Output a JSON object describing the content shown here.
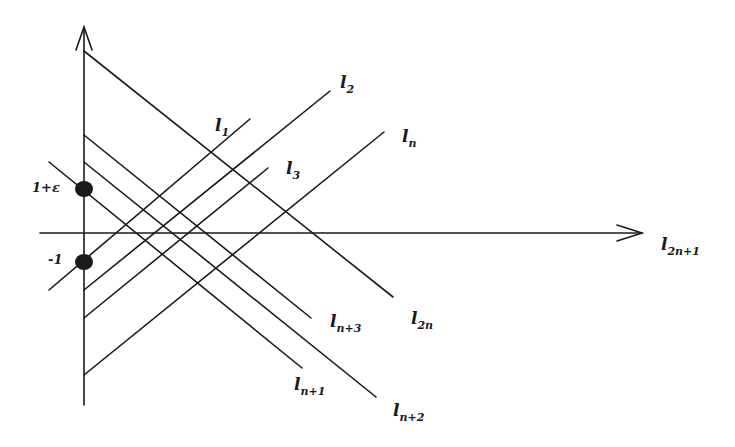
{
  "figure": {
    "type": "line-arrangement",
    "axes": {
      "x_axis_label": "l",
      "x_axis_label_sub": "2n+1",
      "y_axis_arrow": true
    },
    "points": [
      {
        "id": "p1",
        "label": "1+ε",
        "position": "upper"
      },
      {
        "id": "p2",
        "label": "-1",
        "position": "lower"
      }
    ],
    "lines": [
      {
        "label": "l",
        "sub": "1",
        "direction": "ascending"
      },
      {
        "label": "l",
        "sub": "2",
        "direction": "ascending"
      },
      {
        "label": "l",
        "sub": "3",
        "direction": "ascending"
      },
      {
        "label": "l",
        "sub": "n",
        "direction": "ascending"
      },
      {
        "label": "l",
        "sub": "n+1",
        "direction": "descending"
      },
      {
        "label": "l",
        "sub": "n+2",
        "direction": "descending"
      },
      {
        "label": "l",
        "sub": "n+3",
        "direction": "descending"
      },
      {
        "label": "l",
        "sub": "2n",
        "direction": "descending"
      },
      {
        "label": "l",
        "sub": "2n+1",
        "direction": "horizontal"
      }
    ],
    "colors": {
      "ink": "#1a1a1a",
      "background": "#ffffff"
    }
  }
}
